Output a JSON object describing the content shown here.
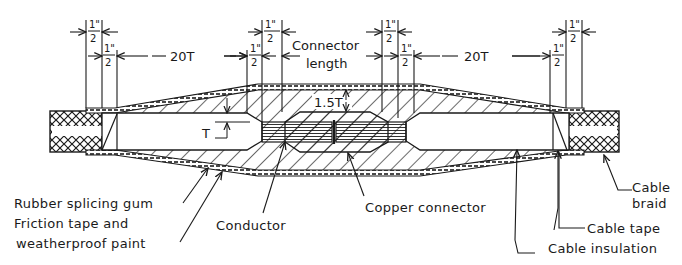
{
  "diagram": {
    "type": "cable-splice-cross-section",
    "colors": {
      "ink": "#1a1a1a",
      "background": "#ffffff"
    },
    "dimensions": {
      "half_inch": {
        "numerator": "1\"",
        "denominator": "2"
      },
      "left_taper": "20T",
      "right_taper": "20T",
      "connector_length_line1": "Connector",
      "connector_length_line2": "length",
      "insulation_thickness": "T",
      "connector_cover": "1.5T"
    },
    "labels": {
      "rubber_splicing_gum": "Rubber splicing gum",
      "friction_tape_line1": "Friction tape and",
      "friction_tape_line2": "weatherproof paint",
      "conductor": "Conductor",
      "copper_connector": "Copper connector",
      "cable_braid_line1": "Cable",
      "cable_braid_line2": "braid",
      "cable_tape": "Cable tape",
      "cable_insulation": "Cable insulation"
    }
  }
}
